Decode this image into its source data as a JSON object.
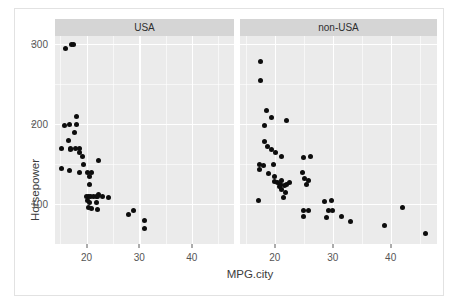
{
  "chart_data": {
    "type": "scatter",
    "title": "",
    "xlabel": "MPG.city",
    "ylabel": "Horsepower",
    "xlim": [
      14,
      48
    ],
    "ylim": [
      50,
      310
    ],
    "xticks": [
      20,
      30,
      40
    ],
    "yticks": [
      100,
      200,
      300
    ],
    "xtick_labels": [
      "20",
      "30",
      "40"
    ],
    "ytick_labels": [
      "100",
      "200",
      "300"
    ],
    "grid": true,
    "legend": "none",
    "facet_variable": "Origin",
    "panel_background": "#ebebeb",
    "grid_color": "#ffffff",
    "point_color": "#0d0d0d",
    "strip_background": "#d5d5d5",
    "facets": [
      {
        "label": "USA",
        "points": [
          {
            "x": 16.0,
            "y": 295
          },
          {
            "x": 17.1,
            "y": 300
          },
          {
            "x": 17.6,
            "y": 300
          },
          {
            "x": 18.0,
            "y": 210
          },
          {
            "x": 16.8,
            "y": 200
          },
          {
            "x": 18.1,
            "y": 200
          },
          {
            "x": 15.8,
            "y": 198
          },
          {
            "x": 17.7,
            "y": 190
          },
          {
            "x": 16.5,
            "y": 180
          },
          {
            "x": 15.3,
            "y": 170
          },
          {
            "x": 17.0,
            "y": 170
          },
          {
            "x": 17.8,
            "y": 170
          },
          {
            "x": 18.6,
            "y": 170
          },
          {
            "x": 17.0,
            "y": 168
          },
          {
            "x": 18.7,
            "y": 165
          },
          {
            "x": 19.3,
            "y": 160
          },
          {
            "x": 22.2,
            "y": 155
          },
          {
            "x": 19.4,
            "y": 150
          },
          {
            "x": 15.2,
            "y": 145
          },
          {
            "x": 16.8,
            "y": 142
          },
          {
            "x": 18.6,
            "y": 140
          },
          {
            "x": 20.1,
            "y": 140
          },
          {
            "x": 21.0,
            "y": 140
          },
          {
            "x": 20.6,
            "y": 135
          },
          {
            "x": 20.6,
            "y": 125
          },
          {
            "x": 22.3,
            "y": 112
          },
          {
            "x": 19.9,
            "y": 110
          },
          {
            "x": 20.3,
            "y": 110
          },
          {
            "x": 20.8,
            "y": 110
          },
          {
            "x": 21.4,
            "y": 110
          },
          {
            "x": 21.9,
            "y": 110
          },
          {
            "x": 22.1,
            "y": 110
          },
          {
            "x": 23.0,
            "y": 110
          },
          {
            "x": 24.2,
            "y": 108
          },
          {
            "x": 20.1,
            "y": 105
          },
          {
            "x": 20.5,
            "y": 102
          },
          {
            "x": 21.8,
            "y": 102
          },
          {
            "x": 20.4,
            "y": 96
          },
          {
            "x": 21.0,
            "y": 95
          },
          {
            "x": 22.0,
            "y": 93
          },
          {
            "x": 29.0,
            "y": 92
          },
          {
            "x": 28.0,
            "y": 87
          },
          {
            "x": 31.0,
            "y": 79
          },
          {
            "x": 31.0,
            "y": 70
          }
        ]
      },
      {
        "label": "non-USA",
        "points": [
          {
            "x": 17.6,
            "y": 278
          },
          {
            "x": 17.5,
            "y": 255
          },
          {
            "x": 18.5,
            "y": 217
          },
          {
            "x": 19.5,
            "y": 208
          },
          {
            "x": 22.0,
            "y": 205
          },
          {
            "x": 18.3,
            "y": 198
          },
          {
            "x": 18.3,
            "y": 178
          },
          {
            "x": 18.8,
            "y": 172
          },
          {
            "x": 19.5,
            "y": 168
          },
          {
            "x": 20.2,
            "y": 164
          },
          {
            "x": 21.2,
            "y": 160
          },
          {
            "x": 25.0,
            "y": 158
          },
          {
            "x": 26.2,
            "y": 160
          },
          {
            "x": 17.3,
            "y": 150
          },
          {
            "x": 18.0,
            "y": 148
          },
          {
            "x": 19.7,
            "y": 150
          },
          {
            "x": 17.4,
            "y": 143
          },
          {
            "x": 24.8,
            "y": 140
          },
          {
            "x": 19.0,
            "y": 138
          },
          {
            "x": 20.0,
            "y": 134
          },
          {
            "x": 21.2,
            "y": 130
          },
          {
            "x": 25.1,
            "y": 132
          },
          {
            "x": 25.8,
            "y": 130
          },
          {
            "x": 19.9,
            "y": 128
          },
          {
            "x": 20.4,
            "y": 127
          },
          {
            "x": 21.0,
            "y": 125
          },
          {
            "x": 22.0,
            "y": 125
          },
          {
            "x": 22.6,
            "y": 127
          },
          {
            "x": 20.8,
            "y": 122
          },
          {
            "x": 21.6,
            "y": 123
          },
          {
            "x": 25.5,
            "y": 124
          },
          {
            "x": 21.1,
            "y": 118
          },
          {
            "x": 21.8,
            "y": 114
          },
          {
            "x": 17.2,
            "y": 105
          },
          {
            "x": 21.5,
            "y": 108
          },
          {
            "x": 28.5,
            "y": 103
          },
          {
            "x": 29.8,
            "y": 105
          },
          {
            "x": 25.0,
            "y": 92
          },
          {
            "x": 25.9,
            "y": 92
          },
          {
            "x": 29.2,
            "y": 92
          },
          {
            "x": 30.0,
            "y": 92
          },
          {
            "x": 24.9,
            "y": 85
          },
          {
            "x": 29.0,
            "y": 83
          },
          {
            "x": 31.5,
            "y": 85
          },
          {
            "x": 33.0,
            "y": 78
          },
          {
            "x": 42.0,
            "y": 96
          },
          {
            "x": 39.0,
            "y": 73
          },
          {
            "x": 46.0,
            "y": 63
          }
        ]
      }
    ]
  }
}
